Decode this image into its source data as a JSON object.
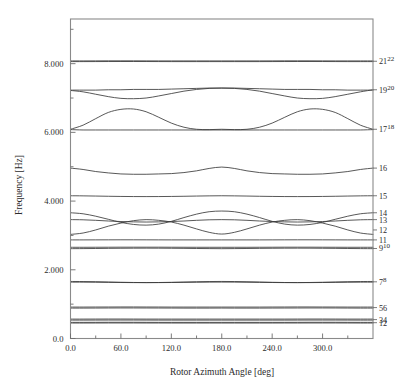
{
  "chart_data": {
    "type": "line",
    "title": "",
    "xlabel": "Rotor Azimuth Angle [deg]",
    "ylabel": "Frequency [Hz]",
    "xlim": [
      0,
      360
    ],
    "ylim": [
      0.0,
      9.3
    ],
    "grid": false,
    "legend_position": "right-axis-mode-numbers",
    "xticks": [
      0,
      60,
      120,
      180,
      240,
      300
    ],
    "xticklabels": [
      "0.0",
      "60.0",
      "120.0",
      "180.0",
      "240.0",
      "300.0"
    ],
    "xminorticks": [
      30,
      90,
      150,
      210,
      270,
      330
    ],
    "yticks": [
      0.0,
      2.0,
      4.0,
      6.0,
      8.0
    ],
    "yticklabels": [
      "0.0",
      "2.000",
      "4.000",
      "6.000",
      "8.000"
    ],
    "yminorticks": [
      1.0,
      3.0,
      5.0,
      7.0,
      9.0
    ],
    "x": [
      0,
      15,
      30,
      45,
      60,
      75,
      90,
      105,
      120,
      135,
      150,
      165,
      180,
      195,
      210,
      225,
      240,
      255,
      270,
      285,
      300,
      315,
      330,
      345,
      360
    ],
    "series": [
      {
        "name": "1",
        "label": "1",
        "values": [
          0.45,
          0.45,
          0.451,
          0.452,
          0.452,
          0.452,
          0.451,
          0.451,
          0.45,
          0.45,
          0.45,
          0.45,
          0.45,
          0.45,
          0.45,
          0.45,
          0.45,
          0.451,
          0.451,
          0.452,
          0.452,
          0.452,
          0.451,
          0.45,
          0.45
        ]
      },
      {
        "name": "2",
        "label": "2",
        "values": [
          0.47,
          0.47,
          0.471,
          0.472,
          0.472,
          0.472,
          0.471,
          0.47,
          0.47,
          0.47,
          0.47,
          0.47,
          0.47,
          0.47,
          0.47,
          0.47,
          0.47,
          0.47,
          0.471,
          0.472,
          0.472,
          0.472,
          0.471,
          0.47,
          0.47
        ]
      },
      {
        "name": "3",
        "label": "3",
        "values": [
          0.535,
          0.535,
          0.536,
          0.537,
          0.537,
          0.537,
          0.536,
          0.535,
          0.535,
          0.535,
          0.535,
          0.535,
          0.535,
          0.535,
          0.535,
          0.535,
          0.535,
          0.535,
          0.536,
          0.537,
          0.537,
          0.537,
          0.536,
          0.535,
          0.535
        ]
      },
      {
        "name": "4",
        "label": "4",
        "values": [
          0.565,
          0.565,
          0.566,
          0.567,
          0.567,
          0.566,
          0.565,
          0.565,
          0.565,
          0.565,
          0.565,
          0.565,
          0.565,
          0.565,
          0.565,
          0.565,
          0.565,
          0.565,
          0.566,
          0.567,
          0.567,
          0.566,
          0.565,
          0.565,
          0.565
        ]
      },
      {
        "name": "5",
        "label": "5",
        "values": [
          0.885,
          0.885,
          0.886,
          0.888,
          0.889,
          0.889,
          0.888,
          0.887,
          0.886,
          0.885,
          0.885,
          0.885,
          0.886,
          0.885,
          0.885,
          0.885,
          0.886,
          0.887,
          0.888,
          0.889,
          0.889,
          0.888,
          0.886,
          0.885,
          0.885
        ]
      },
      {
        "name": "6",
        "label": "6",
        "values": [
          0.915,
          0.915,
          0.916,
          0.917,
          0.918,
          0.918,
          0.917,
          0.916,
          0.915,
          0.915,
          0.915,
          0.915,
          0.915,
          0.915,
          0.915,
          0.915,
          0.916,
          0.917,
          0.918,
          0.918,
          0.917,
          0.916,
          0.915,
          0.915,
          0.915
        ]
      },
      {
        "name": "7",
        "label": "7",
        "values": [
          1.64,
          1.64,
          1.638,
          1.634,
          1.63,
          1.627,
          1.626,
          1.627,
          1.63,
          1.634,
          1.638,
          1.641,
          1.642,
          1.641,
          1.638,
          1.634,
          1.63,
          1.627,
          1.626,
          1.627,
          1.63,
          1.634,
          1.638,
          1.64,
          1.64
        ]
      },
      {
        "name": "8",
        "label": "8",
        "values": [
          1.66,
          1.658,
          1.653,
          1.645,
          1.637,
          1.631,
          1.628,
          1.63,
          1.636,
          1.644,
          1.652,
          1.658,
          1.661,
          1.658,
          1.652,
          1.644,
          1.636,
          1.63,
          1.628,
          1.631,
          1.637,
          1.645,
          1.653,
          1.658,
          1.66
        ]
      },
      {
        "name": "9",
        "label": "9",
        "values": [
          2.615,
          2.617,
          2.62,
          2.624,
          2.627,
          2.629,
          2.63,
          2.629,
          2.627,
          2.624,
          2.62,
          2.617,
          2.615,
          2.617,
          2.62,
          2.624,
          2.627,
          2.629,
          2.63,
          2.629,
          2.627,
          2.624,
          2.62,
          2.617,
          2.615
        ]
      },
      {
        "name": "10",
        "label": "10",
        "values": [
          2.655,
          2.655,
          2.656,
          2.657,
          2.658,
          2.658,
          2.658,
          2.658,
          2.657,
          2.656,
          2.655,
          2.655,
          2.655,
          2.655,
          2.655,
          2.656,
          2.657,
          2.658,
          2.658,
          2.658,
          2.657,
          2.656,
          2.655,
          2.655,
          2.655
        ]
      },
      {
        "name": "11",
        "label": "11",
        "values": [
          2.87,
          2.87,
          2.871,
          2.872,
          2.873,
          2.873,
          2.872,
          2.871,
          2.87,
          2.87,
          2.87,
          2.87,
          2.87,
          2.87,
          2.87,
          2.87,
          2.871,
          2.872,
          2.873,
          2.873,
          2.872,
          2.871,
          2.87,
          2.87,
          2.87
        ]
      },
      {
        "name": "12",
        "label": "12",
        "values": [
          3.03,
          3.07,
          3.16,
          3.27,
          3.36,
          3.43,
          3.46,
          3.44,
          3.39,
          3.3,
          3.19,
          3.09,
          3.04,
          3.09,
          3.19,
          3.3,
          3.39,
          3.44,
          3.46,
          3.43,
          3.36,
          3.27,
          3.16,
          3.07,
          3.03
        ]
      },
      {
        "name": "13",
        "label": "13",
        "values": [
          3.46,
          3.455,
          3.44,
          3.42,
          3.405,
          3.395,
          3.39,
          3.395,
          3.405,
          3.42,
          3.44,
          3.455,
          3.46,
          3.455,
          3.44,
          3.42,
          3.405,
          3.395,
          3.39,
          3.395,
          3.405,
          3.42,
          3.44,
          3.455,
          3.46
        ]
      },
      {
        "name": "14",
        "label": "14",
        "values": [
          3.66,
          3.63,
          3.56,
          3.47,
          3.38,
          3.32,
          3.3,
          3.33,
          3.41,
          3.52,
          3.62,
          3.69,
          3.71,
          3.69,
          3.62,
          3.52,
          3.41,
          3.33,
          3.3,
          3.32,
          3.38,
          3.47,
          3.56,
          3.63,
          3.66
        ]
      },
      {
        "name": "15",
        "label": "15",
        "values": [
          4.155,
          4.152,
          4.146,
          4.14,
          4.135,
          4.132,
          4.131,
          4.132,
          4.135,
          4.14,
          4.146,
          4.152,
          4.155,
          4.152,
          4.146,
          4.14,
          4.135,
          4.132,
          4.131,
          4.132,
          4.135,
          4.14,
          4.146,
          4.152,
          4.155
        ]
      },
      {
        "name": "16",
        "label": "16",
        "values": [
          4.96,
          4.92,
          4.86,
          4.82,
          4.79,
          4.78,
          4.78,
          4.79,
          4.8,
          4.83,
          4.88,
          4.95,
          4.99,
          4.95,
          4.88,
          4.83,
          4.8,
          4.79,
          4.78,
          4.78,
          4.79,
          4.82,
          4.86,
          4.92,
          4.96
        ]
      },
      {
        "name": "17",
        "label": "17",
        "values": [
          6.08,
          6.07,
          6.07,
          6.07,
          6.07,
          6.07,
          6.07,
          6.07,
          6.07,
          6.07,
          6.07,
          6.07,
          6.07,
          6.07,
          6.07,
          6.07,
          6.07,
          6.07,
          6.07,
          6.07,
          6.07,
          6.07,
          6.07,
          6.07,
          6.08
        ]
      },
      {
        "name": "18",
        "label": "18",
        "values": [
          6.09,
          6.21,
          6.4,
          6.58,
          6.67,
          6.68,
          6.6,
          6.44,
          6.27,
          6.15,
          6.09,
          6.08,
          6.09,
          6.08,
          6.09,
          6.15,
          6.27,
          6.44,
          6.6,
          6.68,
          6.67,
          6.58,
          6.4,
          6.21,
          6.09
        ]
      },
      {
        "name": "19",
        "label": "19",
        "values": [
          7.23,
          7.23,
          7.23,
          7.24,
          7.24,
          7.25,
          7.25,
          7.25,
          7.26,
          7.27,
          7.28,
          7.29,
          7.29,
          7.29,
          7.28,
          7.27,
          7.26,
          7.25,
          7.25,
          7.25,
          7.24,
          7.24,
          7.23,
          7.23,
          7.23
        ]
      },
      {
        "name": "20",
        "label": "20",
        "values": [
          7.22,
          7.18,
          7.11,
          7.04,
          6.99,
          6.98,
          7.0,
          7.06,
          7.13,
          7.2,
          7.25,
          7.28,
          7.29,
          7.28,
          7.25,
          7.2,
          7.13,
          7.06,
          7.0,
          6.98,
          6.99,
          7.04,
          7.11,
          7.18,
          7.24
        ]
      },
      {
        "name": "21",
        "label": "21",
        "values": [
          8.06,
          8.06,
          8.061,
          8.062,
          8.063,
          8.063,
          8.062,
          8.061,
          8.06,
          8.06,
          8.06,
          8.06,
          8.06,
          8.06,
          8.06,
          8.06,
          8.061,
          8.062,
          8.063,
          8.063,
          8.062,
          8.061,
          8.06,
          8.06,
          8.06
        ]
      },
      {
        "name": "22",
        "label": "22",
        "values": [
          8.08,
          8.08,
          8.081,
          8.082,
          8.082,
          8.082,
          8.081,
          8.08,
          8.08,
          8.08,
          8.08,
          8.08,
          8.08,
          8.08,
          8.08,
          8.08,
          8.081,
          8.082,
          8.082,
          8.082,
          8.081,
          8.08,
          8.08,
          8.08,
          8.08
        ]
      }
    ],
    "mode_labels": [
      {
        "text": "21",
        "sup": "22",
        "y": 8.07
      },
      {
        "text": "19",
        "sup": "20",
        "y": 7.24
      },
      {
        "text": "17",
        "sup": "18",
        "y": 6.09
      },
      {
        "text": "16",
        "sup": "",
        "y": 4.96
      },
      {
        "text": "15",
        "sup": "",
        "y": 4.155
      },
      {
        "text": "14",
        "sup": "",
        "y": 3.66
      },
      {
        "text": "13",
        "sup": "",
        "y": 3.46
      },
      {
        "text": "12",
        "sup": "",
        "y": 3.16
      },
      {
        "text": "11",
        "sup": "",
        "y": 2.87
      },
      {
        "text": "9",
        "sup": "10",
        "y": 2.62
      },
      {
        "text": "7",
        "sup": "8",
        "y": 1.65
      },
      {
        "text": "56",
        "sup": "",
        "y": 0.9
      },
      {
        "text": "34",
        "sup": "",
        "y": 0.55
      },
      {
        "text": "12",
        "sup": "",
        "y": 0.46
      }
    ]
  }
}
